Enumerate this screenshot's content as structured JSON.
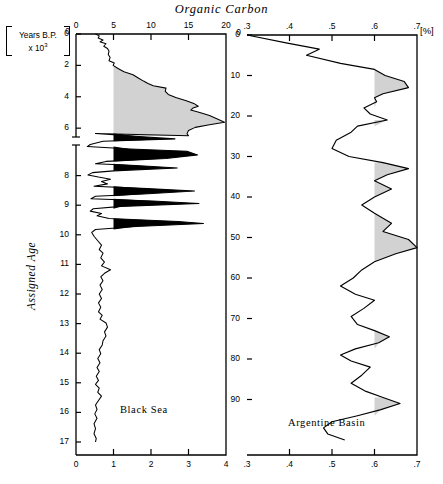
{
  "figure": {
    "title": "Organic Carbon",
    "y_axis_label_line1": "Years B.P.",
    "y_axis_label_line2": "x 10",
    "y_axis_label_exponent": "3",
    "y_axis_name": "Assigned Age",
    "unit_label": "[%]"
  },
  "chart_data": [
    {
      "type": "area",
      "title": "Black Sea",
      "panel": "left",
      "xlabel": "Organic Carbon",
      "ylabel": "Assigned Age [Years B.P. x 10^3]",
      "x_top_axis": {
        "ticks": [
          0,
          5,
          10,
          15,
          20
        ],
        "labels": [
          "0",
          "5",
          "10",
          "15",
          "20"
        ],
        "range": [
          0,
          20
        ]
      },
      "x_bottom_axis": {
        "ticks": [
          0,
          1,
          2,
          3,
          4
        ],
        "labels": [
          "0",
          "1",
          "2",
          "3",
          "4"
        ],
        "range": [
          0,
          4
        ]
      },
      "y_axis": {
        "ticks": [
          0,
          2,
          4,
          6,
          7,
          8,
          9,
          10,
          11,
          12,
          13,
          14,
          15,
          16,
          17
        ],
        "labels": [
          "0",
          "2",
          "4",
          "6",
          "",
          "8",
          "9",
          "10",
          "11",
          "12",
          "13",
          "14",
          "15",
          "16",
          "17"
        ],
        "range": [
          0,
          17
        ],
        "axis_break_between": [
          6.5,
          7.0
        ],
        "inverted": true
      },
      "shading": {
        "fill_gray": "#d2d2d2",
        "fill_black": "#000000",
        "threshold_top": 5.0
      },
      "points": [
        [
          2.6,
          0.0
        ],
        [
          3.1,
          0.12
        ],
        [
          2.95,
          0.25
        ],
        [
          3.6,
          0.38
        ],
        [
          3.2,
          0.5
        ],
        [
          4.0,
          0.62
        ],
        [
          3.7,
          0.78
        ],
        [
          4.2,
          0.92
        ],
        [
          4.4,
          1.1
        ],
        [
          4.3,
          1.3
        ],
        [
          4.55,
          1.5
        ],
        [
          4.4,
          1.7
        ],
        [
          5.1,
          1.85
        ],
        [
          4.95,
          2.0
        ],
        [
          5.6,
          2.2
        ],
        [
          6.4,
          2.4
        ],
        [
          7.6,
          2.6
        ],
        [
          8.3,
          2.8
        ],
        [
          9.0,
          3.0
        ],
        [
          9.6,
          3.15
        ],
        [
          10.3,
          3.3
        ],
        [
          12.0,
          3.45
        ],
        [
          11.9,
          3.65
        ],
        [
          12.3,
          3.85
        ],
        [
          13.3,
          4.05
        ],
        [
          14.7,
          4.25
        ],
        [
          15.8,
          4.45
        ],
        [
          16.3,
          4.6
        ],
        [
          15.6,
          4.72
        ],
        [
          15.3,
          4.85
        ],
        [
          16.5,
          5.0
        ],
        [
          17.8,
          5.2
        ],
        [
          19.0,
          5.45
        ],
        [
          19.8,
          5.62
        ],
        [
          17.6,
          5.8
        ],
        [
          15.9,
          5.95
        ],
        [
          15.0,
          6.15
        ],
        [
          14.8,
          6.35
        ],
        [
          15.0,
          6.48
        ],
        [
          2.6,
          6.58
        ],
        [
          8.4,
          6.68
        ],
        [
          13.2,
          6.76
        ],
        [
          3.6,
          6.84
        ],
        [
          1.9,
          6.95
        ],
        [
          1.5,
          7.02
        ],
        [
          7.2,
          7.1
        ],
        [
          14.8,
          7.18
        ],
        [
          16.2,
          7.3
        ],
        [
          12.0,
          7.42
        ],
        [
          4.0,
          7.52
        ],
        [
          2.6,
          7.6
        ],
        [
          8.0,
          7.66
        ],
        [
          13.5,
          7.74
        ],
        [
          5.0,
          7.84
        ],
        [
          2.2,
          7.9
        ],
        [
          1.6,
          7.98
        ],
        [
          3.0,
          8.05
        ],
        [
          4.6,
          8.12
        ],
        [
          3.4,
          8.2
        ],
        [
          4.2,
          8.28
        ],
        [
          2.4,
          8.36
        ],
        [
          9.5,
          8.44
        ],
        [
          15.8,
          8.52
        ],
        [
          9.0,
          8.62
        ],
        [
          2.6,
          8.7
        ],
        [
          2.0,
          8.78
        ],
        [
          10.2,
          8.86
        ],
        [
          16.4,
          8.94
        ],
        [
          6.0,
          9.04
        ],
        [
          2.3,
          9.12
        ],
        [
          1.9,
          9.2
        ],
        [
          3.4,
          9.28
        ],
        [
          2.8,
          9.36
        ],
        [
          4.4,
          9.45
        ],
        [
          13.6,
          9.55
        ],
        [
          17.0,
          9.62
        ],
        [
          8.0,
          9.72
        ],
        [
          2.6,
          9.82
        ],
        [
          2.1,
          9.92
        ],
        [
          2.4,
          10.05
        ],
        [
          2.9,
          10.2
        ],
        [
          3.4,
          10.35
        ],
        [
          3.1,
          10.5
        ],
        [
          3.6,
          10.62
        ],
        [
          3.3,
          10.78
        ],
        [
          3.8,
          10.92
        ],
        [
          3.4,
          11.05
        ],
        [
          4.6,
          11.18
        ],
        [
          3.8,
          11.3
        ],
        [
          3.3,
          11.42
        ],
        [
          3.6,
          11.55
        ],
        [
          3.2,
          11.7
        ],
        [
          3.5,
          11.85
        ],
        [
          3.1,
          12.0
        ],
        [
          3.4,
          12.15
        ],
        [
          3.0,
          12.3
        ],
        [
          3.3,
          12.45
        ],
        [
          3.0,
          12.6
        ],
        [
          3.5,
          12.72
        ],
        [
          3.2,
          12.85
        ],
        [
          4.0,
          12.98
        ],
        [
          4.2,
          13.12
        ],
        [
          3.8,
          13.28
        ],
        [
          4.0,
          13.42
        ],
        [
          3.6,
          13.58
        ],
        [
          3.5,
          13.72
        ],
        [
          3.1,
          13.88
        ],
        [
          3.3,
          14.02
        ],
        [
          2.9,
          14.18
        ],
        [
          3.2,
          14.32
        ],
        [
          2.8,
          14.48
        ],
        [
          3.1,
          14.62
        ],
        [
          2.7,
          14.78
        ],
        [
          3.0,
          14.92
        ],
        [
          2.6,
          15.05
        ],
        [
          3.1,
          15.18
        ],
        [
          2.9,
          15.32
        ],
        [
          3.4,
          15.45
        ],
        [
          3.0,
          15.6
        ],
        [
          2.6,
          15.75
        ],
        [
          2.8,
          15.9
        ],
        [
          2.5,
          16.05
        ],
        [
          2.8,
          16.2
        ],
        [
          2.4,
          16.38
        ],
        [
          2.6,
          16.55
        ],
        [
          2.4,
          16.72
        ],
        [
          2.7,
          16.88
        ],
        [
          2.6,
          17.0
        ]
      ],
      "points_note": "x values expressed on the 0-20 top-axis scale"
    },
    {
      "type": "area",
      "title": "Argentine Basin",
      "panel": "right",
      "xlabel": "Organic Carbon",
      "ylabel": "Depth",
      "x_top_axis": {
        "ticks": [
          0.3,
          0.4,
          0.5,
          0.6,
          0.7
        ],
        "labels": [
          ".3",
          ".4",
          ".5",
          ".6",
          ".7"
        ],
        "range": [
          0.3,
          0.7
        ]
      },
      "x_bottom_axis": {
        "ticks": [
          0.3,
          0.4,
          0.5,
          0.6,
          0.7
        ],
        "labels": [
          ".3",
          ".4",
          ".5",
          ".6",
          ".7"
        ],
        "range": [
          0.3,
          0.7
        ]
      },
      "y_axis": {
        "ticks": [
          0,
          10,
          20,
          30,
          40,
          50,
          60,
          70,
          80,
          90
        ],
        "labels": [
          "0",
          "10",
          "20",
          "30",
          "40",
          "50",
          "60",
          "70",
          "80",
          "90"
        ],
        "range": [
          0,
          90
        ],
        "inverted": true
      },
      "shading": {
        "fill_gray": "#d2d2d2",
        "threshold": 0.6
      },
      "points": [
        [
          0.3,
          0.0
        ],
        [
          0.395,
          2.0
        ],
        [
          0.47,
          3.5
        ],
        [
          0.44,
          5.0
        ],
        [
          0.52,
          7.0
        ],
        [
          0.6,
          8.5
        ],
        [
          0.625,
          10.0
        ],
        [
          0.67,
          11.5
        ],
        [
          0.68,
          13.0
        ],
        [
          0.62,
          14.5
        ],
        [
          0.6,
          15.5
        ],
        [
          0.605,
          16.5
        ],
        [
          0.575,
          18.0
        ],
        [
          0.59,
          19.5
        ],
        [
          0.63,
          21.0
        ],
        [
          0.56,
          22.5
        ],
        [
          0.545,
          24.0
        ],
        [
          0.51,
          26.0
        ],
        [
          0.5,
          28.0
        ],
        [
          0.54,
          30.0
        ],
        [
          0.62,
          31.5
        ],
        [
          0.68,
          33.0
        ],
        [
          0.63,
          34.5
        ],
        [
          0.6,
          36.0
        ],
        [
          0.64,
          38.0
        ],
        [
          0.6,
          40.0
        ],
        [
          0.57,
          42.0
        ],
        [
          0.6,
          44.0
        ],
        [
          0.64,
          46.5
        ],
        [
          0.62,
          48.5
        ],
        [
          0.68,
          50.5
        ],
        [
          0.7,
          52.5
        ],
        [
          0.65,
          54.0
        ],
        [
          0.6,
          56.0
        ],
        [
          0.57,
          58.0
        ],
        [
          0.55,
          60.0
        ],
        [
          0.52,
          62.0
        ],
        [
          0.555,
          64.0
        ],
        [
          0.6,
          65.5
        ],
        [
          0.575,
          67.5
        ],
        [
          0.545,
          69.5
        ],
        [
          0.56,
          71.5
        ],
        [
          0.6,
          73.0
        ],
        [
          0.635,
          74.5
        ],
        [
          0.61,
          76.0
        ],
        [
          0.555,
          77.5
        ],
        [
          0.52,
          79.0
        ],
        [
          0.545,
          80.5
        ],
        [
          0.59,
          82.0
        ],
        [
          0.57,
          84.0
        ],
        [
          0.545,
          86.0
        ],
        [
          0.58,
          88.0
        ],
        [
          0.62,
          89.5
        ],
        [
          0.66,
          91.0
        ],
        [
          0.615,
          92.5
        ],
        [
          0.56,
          94.0
        ],
        [
          0.5,
          95.5
        ],
        [
          0.48,
          97.0
        ],
        [
          0.49,
          98.5
        ],
        [
          0.53,
          100.0
        ]
      ],
      "points_note": "x in percent organic carbon; y on the depth scale 0-90"
    }
  ],
  "colors": {
    "line": "#000000",
    "gray_fill": "#d2d2d2",
    "black_fill": "#000000",
    "background": "#ffffff"
  }
}
